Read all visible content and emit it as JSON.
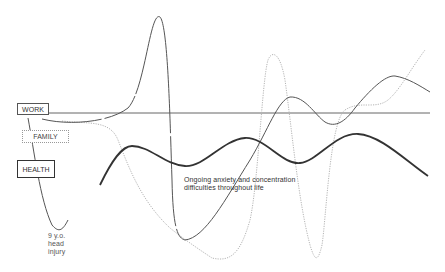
{
  "labels": {
    "work": "WORK",
    "family": "FAMILY",
    "health": "HEALTH"
  },
  "annotations": {
    "injury_line1": "9 y.o.",
    "injury_line2": "head",
    "injury_line3": "injury",
    "anxiety_line1": "Ongoing anxiety and concentration",
    "anxiety_line2": "difficulties throughout life"
  },
  "colors": {
    "work": "#555555",
    "family": "#b0b0b0",
    "health": "#333333",
    "baseline": "#666666"
  }
}
